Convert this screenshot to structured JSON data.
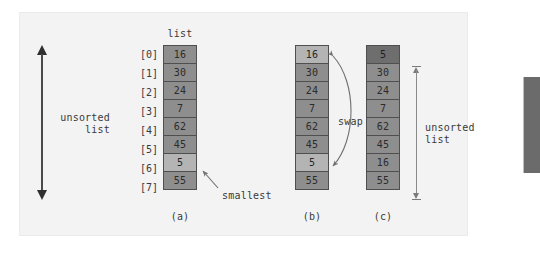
{
  "figure": {
    "caption_list_header": "list",
    "panels": [
      {
        "id": "a",
        "caption": "(a)",
        "indices": [
          "[0]",
          "[1]",
          "[2]",
          "[3]",
          "[4]",
          "[5]",
          "[6]",
          "[7]"
        ],
        "values": [
          "16",
          "30",
          "24",
          "7",
          "62",
          "45",
          "5",
          "55"
        ],
        "highlighted": [
          6
        ]
      },
      {
        "id": "b",
        "caption": "(b)",
        "values": [
          "16",
          "30",
          "24",
          "7",
          "62",
          "45",
          "5",
          "55"
        ],
        "highlighted": [
          0,
          6
        ]
      },
      {
        "id": "c",
        "caption": "(c)",
        "values": [
          "5",
          "30",
          "24",
          "7",
          "62",
          "45",
          "16",
          "55"
        ],
        "sorted": [
          0
        ]
      }
    ],
    "annotations": {
      "unsorted_left_line1": "unsorted",
      "unsorted_left_line2": "list",
      "unsorted_right_line1": "unsorted",
      "unsorted_right_line2": "list",
      "smallest": "smallest",
      "swap": "swap"
    },
    "colors": {
      "panel_bg": "#f3f3f3",
      "cell_bg": "#8e8e8e",
      "cell_bg_highlight": "#b4b4b4",
      "cell_bg_sorted": "#6e6e6e",
      "cell_border": "#4f4f4f",
      "text": "#3a3a3a",
      "arrow_thick": "#2f2f2f",
      "arrow_thin": "#7a7a7a",
      "right_bar": "#6b6b6b"
    }
  }
}
